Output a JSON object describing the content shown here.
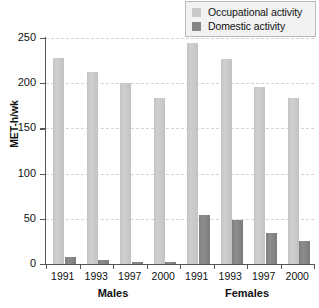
{
  "chart_data": {
    "type": "bar",
    "title": "",
    "xlabel": "",
    "ylabel": "MET-h/wk",
    "ylim": [
      0,
      250
    ],
    "yticks": [
      0,
      50,
      100,
      150,
      200,
      250
    ],
    "grid": true,
    "legend_position": "top-right",
    "categories": [
      "1991",
      "1993",
      "1997",
      "2000",
      "1991",
      "1993",
      "1997",
      "2000"
    ],
    "groups": [
      {
        "label": "Males",
        "categories": [
          "1991",
          "1993",
          "1997",
          "2000"
        ]
      },
      {
        "label": "Females",
        "categories": [
          "1991",
          "1993",
          "1997",
          "2000"
        ]
      }
    ],
    "series": [
      {
        "name": "Occupational activity",
        "color": "#c9c9c9",
        "values": [
          228,
          212,
          200,
          184,
          245,
          227,
          196,
          184
        ]
      },
      {
        "name": "Domestic activity",
        "color": "#858585",
        "values": [
          8,
          4,
          2,
          2,
          54,
          49,
          34,
          26
        ]
      }
    ]
  },
  "legend": {
    "items": [
      {
        "label": "Occupational activity",
        "color": "#c9c9c9"
      },
      {
        "label": "Domestic activity",
        "color": "#858585"
      }
    ]
  }
}
